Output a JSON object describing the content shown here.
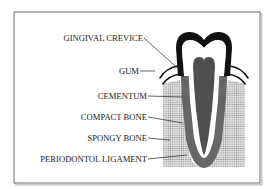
{
  "diagram": {
    "labels": [
      {
        "id": "gingival-crevice",
        "text": "GINGIVAL CREVICE",
        "x": 143,
        "y": 41,
        "lx1": 144,
        "ly1": 38,
        "lx2": 183,
        "ly2": 73
      },
      {
        "id": "gum",
        "text": "GUM",
        "x": 139,
        "y": 74,
        "lx1": 140,
        "ly1": 71,
        "lx2": 154,
        "ly2": 71
      },
      {
        "id": "cementum",
        "text": "CEMENTUM",
        "x": 147,
        "y": 99,
        "lx1": 148,
        "ly1": 96,
        "lx2": 183,
        "ly2": 97
      },
      {
        "id": "compact-bone",
        "text": "COMPACT BONE",
        "x": 147,
        "y": 120,
        "lx1": 148,
        "ly1": 117,
        "lx2": 182,
        "ly2": 123
      },
      {
        "id": "spongy-bone",
        "text": "SPONGY BONE",
        "x": 147,
        "y": 141,
        "lx1": 148,
        "ly1": 138,
        "lx2": 170,
        "ly2": 140
      },
      {
        "id": "periodontol-ligament",
        "text": "PERIODONTOL LIGAMENT",
        "x": 147,
        "y": 162,
        "lx1": 148,
        "ly1": 159,
        "lx2": 186,
        "ly2": 155
      }
    ],
    "colors": {
      "frame": "#6e6e6e",
      "enamel": "#111111",
      "dentin": "#ffffff",
      "pulp": "#555555",
      "root_outer": "#6a6a6a",
      "bone_dots": "#9a9a9a",
      "gum_line": "#111111",
      "text": "#1a1a1a"
    }
  }
}
